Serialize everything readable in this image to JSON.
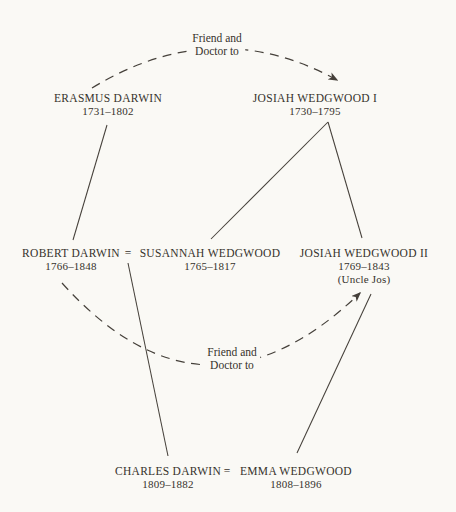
{
  "colors": {
    "background": "#faf9f5",
    "ink": "#36322c",
    "line": "#45403a"
  },
  "annotations": {
    "top": {
      "line1": "Friend and",
      "line2": "Doctor to"
    },
    "bottom": {
      "line1": "Friend and",
      "line2": "Doctor to"
    }
  },
  "marriage_symbol": "=",
  "people": {
    "erasmus": {
      "name": "ERASMUS DARWIN",
      "dates": "1731–1802"
    },
    "josiah1": {
      "name": "JOSIAH WEDGWOOD I",
      "dates": "1730–1795"
    },
    "robert": {
      "name": "ROBERT DARWIN",
      "dates": "1766–1848"
    },
    "susannah": {
      "name": "SUSANNAH WEDGWOOD",
      "dates": "1765–1817"
    },
    "josiah2": {
      "name": "JOSIAH WEDGWOOD II",
      "dates": "1769–1843",
      "note": "(Uncle Jos)"
    },
    "charles": {
      "name": "CHARLES DARWIN",
      "dates": "1809–1882"
    },
    "emma": {
      "name": "EMMA WEDGWOOD",
      "dates": "1808–1896"
    }
  },
  "relations": {
    "erasmus_to_josiah1": "Friend and Doctor to",
    "robert_to_josiah2": "Friend and Doctor to",
    "erasmus_to_robert": "parent",
    "josiah1_to_susannah": "parent",
    "josiah1_to_josiah2": "parent",
    "robert_susannah_to_charles": "parent",
    "josiah2_to_emma": "parent"
  }
}
